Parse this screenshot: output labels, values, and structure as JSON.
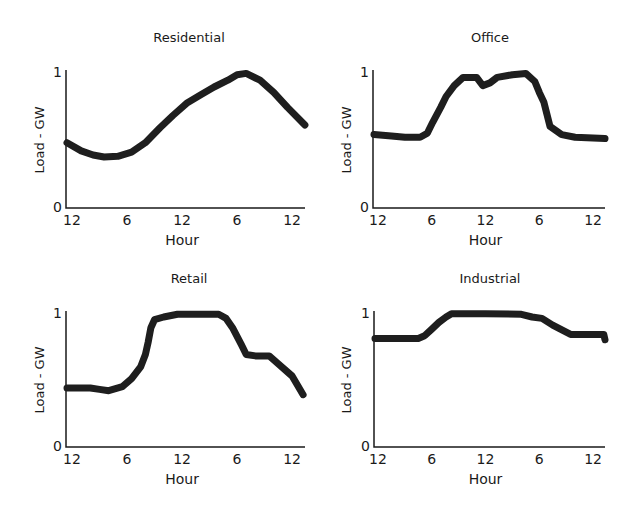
{
  "figure": {
    "panels": [
      {
        "title": "Residential",
        "ylabel": "Load - GW",
        "xlabel": "Hour"
      },
      {
        "title": "Office",
        "ylabel": "Load - GW",
        "xlabel": "Hour"
      },
      {
        "title": "Retail",
        "ylabel": "Load - GW",
        "xlabel": "Hour"
      },
      {
        "title": "Industrial",
        "ylabel": "Load - GW",
        "xlabel": "Hour"
      }
    ],
    "ytick_labels": [
      "0",
      "1"
    ],
    "xtick_labels": [
      "12",
      "6",
      "12",
      "6",
      "12"
    ],
    "line_color": "#1e1e1e"
  },
  "chart_data": [
    {
      "type": "line",
      "title": "Residential",
      "xlabel": "Hour",
      "ylabel": "Load - GW",
      "xticks": [
        0,
        6,
        12,
        18,
        24
      ],
      "xtick_labels": [
        "12",
        "6",
        "12",
        "6",
        "12"
      ],
      "yticks": [
        0,
        1
      ],
      "ylim": [
        0,
        1
      ],
      "xlim": [
        -0.6,
        25.4
      ],
      "grid": false,
      "x": [
        -0.6,
        1,
        2.3,
        3.5,
        5,
        6.5,
        8,
        9.6,
        11,
        12.5,
        14,
        15.5,
        17,
        18,
        19,
        20.5,
        22,
        23.5,
        25.4
      ],
      "values": [
        0.48,
        0.42,
        0.39,
        0.375,
        0.38,
        0.41,
        0.48,
        0.59,
        0.68,
        0.77,
        0.83,
        0.89,
        0.94,
        0.98,
        0.99,
        0.94,
        0.85,
        0.74,
        0.61
      ]
    },
    {
      "type": "line",
      "title": "Office",
      "xlabel": "Hour",
      "ylabel": "Load - GW",
      "xticks": [
        0,
        6,
        12,
        18,
        24
      ],
      "xtick_labels": [
        "12",
        "6",
        "12",
        "6",
        "12"
      ],
      "yticks": [
        0,
        1
      ],
      "ylim": [
        0,
        1
      ],
      "xlim": [
        -0.6,
        25.5
      ],
      "grid": false,
      "x": [
        -0.6,
        1.5,
        3,
        4.7,
        5.5,
        6.1,
        7,
        7.6,
        8.5,
        9.5,
        11,
        11.7,
        12.5,
        13.3,
        15,
        16.5,
        17.5,
        18,
        18.5,
        19.2,
        20.5,
        22,
        25.5
      ],
      "values": [
        0.54,
        0.53,
        0.52,
        0.52,
        0.55,
        0.63,
        0.74,
        0.82,
        0.9,
        0.96,
        0.96,
        0.9,
        0.92,
        0.96,
        0.98,
        0.99,
        0.93,
        0.85,
        0.78,
        0.6,
        0.54,
        0.52,
        0.51
      ]
    },
    {
      "type": "line",
      "title": "Retail",
      "xlabel": "Hour",
      "ylabel": "Load - GW",
      "xticks": [
        0,
        6,
        12,
        18,
        24
      ],
      "xtick_labels": [
        "12",
        "6",
        "12",
        "6",
        "12"
      ],
      "yticks": [
        0,
        1
      ],
      "ylim": [
        0,
        1
      ],
      "xlim": [
        -0.6,
        25.4
      ],
      "grid": false,
      "x": [
        -0.6,
        2,
        3,
        4,
        5.5,
        6.5,
        7.5,
        8.0,
        8.3,
        8.6,
        9,
        10,
        11.5,
        13,
        16,
        16.8,
        17.5,
        18.5,
        19,
        20,
        21.5,
        22.5,
        24,
        25.2
      ],
      "values": [
        0.44,
        0.44,
        0.43,
        0.42,
        0.45,
        0.51,
        0.6,
        0.69,
        0.78,
        0.89,
        0.95,
        0.97,
        0.99,
        0.99,
        0.99,
        0.96,
        0.89,
        0.76,
        0.69,
        0.68,
        0.68,
        0.62,
        0.53,
        0.39
      ]
    },
    {
      "type": "line",
      "title": "Industrial",
      "xlabel": "Hour",
      "ylabel": "Load - GW",
      "xticks": [
        0,
        6,
        12,
        18,
        24
      ],
      "xtick_labels": [
        "12",
        "6",
        "12",
        "6",
        "12"
      ],
      "yticks": [
        0,
        1
      ],
      "ylim": [
        0,
        1
      ],
      "xlim": [
        -0.5,
        25.4
      ],
      "grid": false,
      "x": [
        -0.5,
        2,
        4.5,
        5.2,
        6,
        6.8,
        7.6,
        8.2,
        12,
        16,
        17.2,
        18.3,
        19.5,
        21.5,
        22,
        24,
        25.2,
        25.4
      ],
      "values": [
        0.81,
        0.81,
        0.81,
        0.83,
        0.88,
        0.93,
        0.97,
        0.995,
        0.995,
        0.99,
        0.97,
        0.96,
        0.91,
        0.84,
        0.84,
        0.84,
        0.84,
        0.8
      ]
    }
  ]
}
